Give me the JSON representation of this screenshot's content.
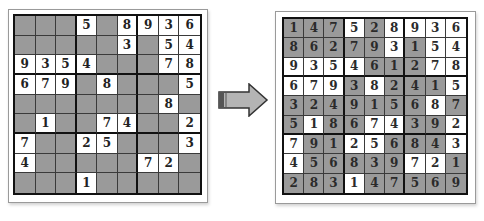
{
  "colors": {
    "given_cell": "#ffffff",
    "blank_cell": "#9a9a9a",
    "grid_line": "#111111",
    "arrow_fill": "#b4b4b4",
    "arrow_stroke": "#333333"
  },
  "puzzle": {
    "label": "unsolved-sudoku",
    "rows": [
      [
        "",
        "",
        "",
        "5",
        "",
        "8",
        "9",
        "3",
        "6"
      ],
      [
        "",
        "",
        "",
        "",
        "",
        "3",
        "",
        "5",
        "4"
      ],
      [
        "9",
        "3",
        "5",
        "4",
        "",
        "",
        "",
        "7",
        "8"
      ],
      [
        "6",
        "7",
        "9",
        "",
        "8",
        "",
        "",
        "",
        "5"
      ],
      [
        "",
        "",
        "",
        "",
        "",
        "",
        "",
        "8",
        ""
      ],
      [
        "",
        "1",
        "",
        "",
        "7",
        "4",
        "",
        "",
        "2"
      ],
      [
        "7",
        "",
        "",
        "2",
        "5",
        "",
        "",
        "",
        "3"
      ],
      [
        "4",
        "",
        "",
        "",
        "",
        "",
        "7",
        "2",
        ""
      ],
      [
        "",
        "",
        "",
        "1",
        "",
        "",
        "",
        "",
        ""
      ]
    ]
  },
  "solution": {
    "label": "solved-sudoku",
    "rows": [
      [
        "1",
        "4",
        "7",
        "5",
        "2",
        "8",
        "9",
        "3",
        "6"
      ],
      [
        "8",
        "6",
        "2",
        "7",
        "9",
        "3",
        "1",
        "5",
        "4"
      ],
      [
        "9",
        "3",
        "5",
        "4",
        "6",
        "1",
        "2",
        "7",
        "8"
      ],
      [
        "6",
        "7",
        "9",
        "3",
        "8",
        "2",
        "4",
        "1",
        "5"
      ],
      [
        "3",
        "2",
        "4",
        "9",
        "1",
        "5",
        "6",
        "8",
        "7"
      ],
      [
        "5",
        "1",
        "8",
        "6",
        "7",
        "4",
        "3",
        "9",
        "2"
      ],
      [
        "7",
        "9",
        "1",
        "2",
        "5",
        "6",
        "8",
        "4",
        "3"
      ],
      [
        "4",
        "5",
        "6",
        "8",
        "3",
        "9",
        "7",
        "2",
        "1"
      ],
      [
        "2",
        "8",
        "3",
        "1",
        "4",
        "7",
        "5",
        "6",
        "9"
      ]
    ],
    "given_mask": [
      [
        0,
        0,
        0,
        1,
        0,
        1,
        1,
        1,
        1
      ],
      [
        0,
        0,
        0,
        0,
        0,
        1,
        0,
        1,
        1
      ],
      [
        1,
        1,
        1,
        1,
        0,
        0,
        0,
        1,
        1
      ],
      [
        1,
        1,
        1,
        0,
        1,
        0,
        0,
        0,
        1
      ],
      [
        0,
        0,
        0,
        0,
        0,
        0,
        0,
        1,
        0
      ],
      [
        0,
        1,
        0,
        0,
        1,
        1,
        0,
        0,
        1
      ],
      [
        1,
        0,
        0,
        1,
        1,
        0,
        0,
        0,
        1
      ],
      [
        1,
        0,
        0,
        0,
        0,
        0,
        1,
        1,
        0
      ],
      [
        0,
        0,
        0,
        1,
        0,
        0,
        0,
        0,
        0
      ]
    ]
  },
  "arrow": {
    "icon": "right-arrow-icon",
    "direction": "right"
  }
}
